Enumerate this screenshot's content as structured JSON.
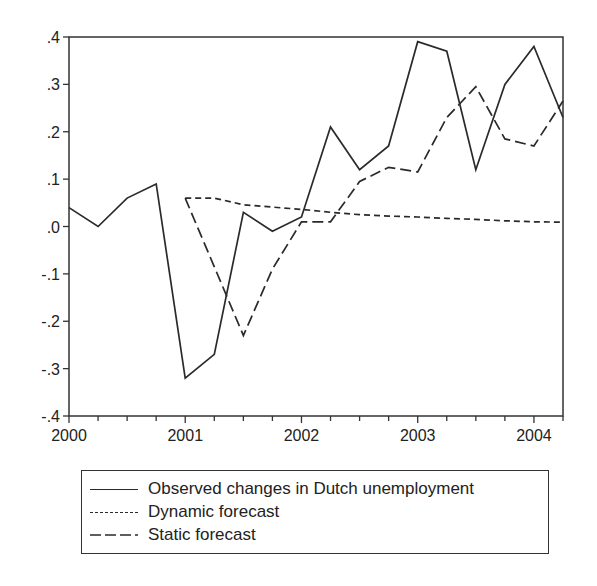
{
  "chart_data": {
    "type": "line",
    "title": "",
    "xlabel": "",
    "ylabel": "",
    "ylim": [
      -0.4,
      0.4
    ],
    "yticks": [
      ".4",
      ".3",
      ".2",
      ".1",
      ".0",
      "-.1",
      "-.2",
      "-.3",
      "-.4"
    ],
    "ytick_values": [
      0.4,
      0.3,
      0.2,
      0.1,
      0.0,
      -0.1,
      -0.2,
      -0.3,
      -0.4
    ],
    "xticks": [
      "2000",
      "2001",
      "2002",
      "2003",
      "2004"
    ],
    "x_frequency": "quarterly",
    "x": [
      "2000Q1",
      "2000Q2",
      "2000Q3",
      "2000Q4",
      "2001Q1",
      "2001Q2",
      "2001Q3",
      "2001Q4",
      "2002Q1",
      "2002Q2",
      "2002Q3",
      "2002Q4",
      "2003Q1",
      "2003Q2",
      "2003Q3",
      "2003Q4",
      "2004Q1",
      "2004Q2"
    ],
    "grid": false,
    "legend_position": "bottom",
    "series": [
      {
        "name": "Observed changes in Dutch unemployment",
        "style": "solid",
        "values": [
          0.04,
          0.0,
          0.06,
          0.09,
          -0.32,
          -0.27,
          0.03,
          -0.01,
          0.02,
          0.21,
          0.12,
          0.17,
          0.39,
          0.37,
          0.12,
          0.3,
          0.38,
          0.23
        ]
      },
      {
        "name": "Dynamic forecast",
        "style": "short-dash",
        "values": [
          null,
          null,
          null,
          null,
          0.06,
          0.06,
          0.046,
          0.041,
          0.036,
          0.03,
          0.025,
          0.022,
          0.02,
          0.017,
          0.015,
          0.012,
          0.01,
          0.009
        ]
      },
      {
        "name": "Static forecast",
        "style": "long-dash",
        "values": [
          null,
          null,
          null,
          null,
          0.06,
          -0.085,
          -0.23,
          -0.09,
          0.01,
          0.01,
          0.095,
          0.125,
          0.115,
          0.23,
          0.295,
          0.185,
          0.17,
          0.265
        ]
      }
    ]
  },
  "legend": {
    "items": [
      {
        "label": "Observed changes in Dutch unemployment",
        "style": "solid"
      },
      {
        "label": "Dynamic forecast",
        "style": "short-dash"
      },
      {
        "label": "Static forecast",
        "style": "long-dash"
      }
    ]
  },
  "colors": {
    "line": "#2a2a2a",
    "axis": "#333333",
    "background": "#ffffff"
  }
}
